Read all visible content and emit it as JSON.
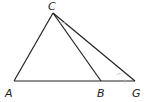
{
  "diagram": {
    "points": {
      "A": {
        "label": "A",
        "x": 14,
        "y": 81
      },
      "B": {
        "label": "B",
        "x": 101,
        "y": 81
      },
      "C": {
        "label": "C",
        "x": 53,
        "y": 13
      },
      "G": {
        "label": "G",
        "x": 135,
        "y": 81
      }
    },
    "segments": [
      "AC",
      "CB",
      "CG",
      "AG"
    ],
    "line_color": "#222222",
    "mark_color": "#b0b0b0"
  }
}
